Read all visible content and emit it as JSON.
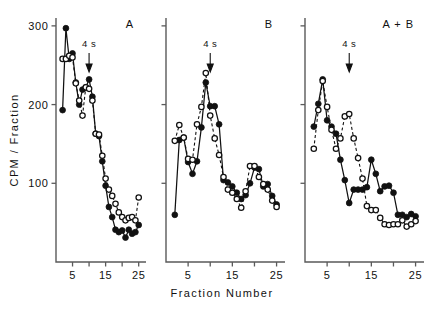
{
  "figure": {
    "y_axis_title": "CPM / Fraction",
    "x_axis_title": "Fraction  Number",
    "annotation_label": "4 s"
  },
  "panels": [
    {
      "label": "A"
    },
    {
      "label": "B"
    },
    {
      "label": "A + B"
    }
  ],
  "chart_data": {
    "type": "line",
    "title": "",
    "xlabel": "Fraction  Number",
    "ylabel": "CPM / Fraction",
    "xlim": [
      0,
      26
    ],
    "ylim": [
      0,
      310
    ],
    "xticks": [
      5,
      10,
      15,
      20,
      25
    ],
    "xticklabels": [
      "5",
      "",
      "15",
      "",
      "25"
    ],
    "yticks": [
      100,
      200,
      300
    ],
    "yticklabels": [
      "100",
      "200",
      "300"
    ],
    "grid": false,
    "legend": "none",
    "annotations": [
      {
        "text": "4 s",
        "panel": "A",
        "x": 10,
        "marker": "down-arrow"
      },
      {
        "text": "4 s",
        "panel": "B",
        "x": 10,
        "marker": "down-arrow"
      },
      {
        "text": "4 s",
        "panel": "A + B",
        "x": 10,
        "marker": "down-arrow"
      }
    ],
    "panels": [
      {
        "name": "A",
        "label": "A",
        "series": [
          {
            "name": "filled-circles-solid",
            "marker": "filled-circle",
            "linestyle": "solid",
            "x": [
              2,
              3,
              4,
              5,
              6,
              7,
              8,
              9,
              10,
              11,
              12,
              13,
              14,
              15,
              16,
              17,
              18,
              19,
              20,
              21,
              22,
              23,
              24,
              25
            ],
            "y": [
              193,
              297,
              258,
              265,
              228,
              200,
              219,
              222,
              232,
              210,
              163,
              160,
              128,
              97,
              70,
              57,
              41,
              38,
              40,
              31,
              41,
              36,
              38,
              47
            ]
          },
          {
            "name": "open-circles-dashed",
            "marker": "open-circle",
            "linestyle": "dashed",
            "x": [
              2,
              3,
              4,
              5,
              6,
              7,
              8,
              9,
              10,
              11,
              12,
              13,
              14,
              15,
              16,
              17,
              18,
              19,
              20,
              21,
              22,
              23,
              24,
              25
            ],
            "y": [
              258,
              258,
              262,
              260,
              227,
              205,
              186,
              222,
              220,
              205,
              163,
              162,
              135,
              106,
              92,
              84,
              74,
              63,
              57,
              53,
              56,
              57,
              53,
              82
            ]
          }
        ]
      },
      {
        "name": "B",
        "label": "B",
        "series": [
          {
            "name": "filled-circles-solid",
            "marker": "filled-circle",
            "linestyle": "solid",
            "x": [
              2,
              3,
              4,
              5,
              6,
              7,
              8,
              9,
              10,
              11,
              12,
              13,
              14,
              15,
              16,
              17,
              18,
              19,
              20,
              21,
              22,
              23,
              24,
              25
            ],
            "y": [
              60,
              155,
              158,
              127,
              112,
              128,
              171,
              228,
              198,
              198,
              175,
              104,
              101,
              96,
              88,
              80,
              85,
              100,
              120,
              118,
              96,
              99,
              84,
              73
            ]
          },
          {
            "name": "open-circles-dashed",
            "marker": "open-circle",
            "linestyle": "dashed",
            "x": [
              2,
              3,
              4,
              5,
              6,
              7,
              8,
              9,
              10,
              11,
              12,
              13,
              14,
              15,
              16,
              17,
              18,
              19,
              20,
              21,
              22,
              23,
              24,
              25
            ],
            "y": [
              154,
              174,
              158,
              131,
              130,
              175,
              197,
              240,
              186,
              157,
              136,
              108,
              92,
              88,
              80,
              69,
              90,
              122,
              122,
              108,
              99,
              92,
              78,
              70
            ]
          }
        ]
      },
      {
        "name": "A + B",
        "label": "A + B",
        "series": [
          {
            "name": "filled-circles-solid",
            "marker": "filled-circle",
            "linestyle": "solid",
            "x": [
              2,
              3,
              4,
              5,
              6,
              7,
              8,
              9,
              10,
              11,
              12,
              13,
              14,
              15,
              16,
              17,
              18,
              19,
              20,
              21,
              22,
              23,
              24,
              25
            ],
            "y": [
              172,
              201,
              232,
              180,
              172,
              163,
              130,
              104,
              75,
              92,
              92,
              92,
              95,
              130,
              112,
              90,
              96,
              97,
              88,
              60,
              60,
              57,
              61,
              58
            ]
          },
          {
            "name": "open-circles-dashed",
            "marker": "open-circle",
            "linestyle": "dashed",
            "x": [
              2,
              3,
              4,
              5,
              6,
              7,
              8,
              9,
              10,
              11,
              12,
              13,
              14,
              15,
              16,
              17,
              18,
              19,
              20,
              21,
              22,
              23,
              24,
              25
            ],
            "y": [
              144,
              193,
              230,
              197,
              168,
              144,
              157,
              185,
              188,
              157,
              132,
              106,
              71,
              66,
              66,
              56,
              48,
              47,
              48,
              48,
              53,
              45,
              48,
              52
            ]
          }
        ]
      }
    ]
  }
}
